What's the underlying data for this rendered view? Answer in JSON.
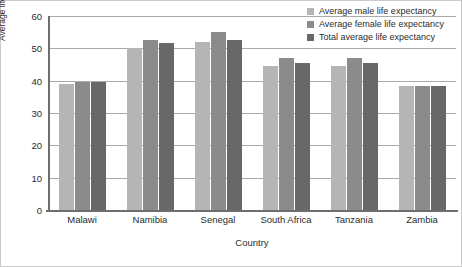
{
  "chart_data": {
    "type": "bar",
    "title": "",
    "xlabel": "Country",
    "ylabel": "Average life expectancy age",
    "categories": [
      "Malawi",
      "Namibia",
      "Senegal",
      "South Africa",
      "Tanzania",
      "Zambia"
    ],
    "series": [
      {
        "name": "Average male life expectancy",
        "color": "#b5b5b5",
        "values": [
          39,
          50,
          52,
          44.5,
          44.5,
          38.5
        ]
      },
      {
        "name": "Average female life expectancy",
        "color": "#8b8b8b",
        "values": [
          39.5,
          52.5,
          55,
          47,
          47,
          38.5
        ]
      },
      {
        "name": "Total average life expectancy",
        "color": "#686868",
        "values": [
          39.5,
          51.5,
          52.5,
          45.5,
          45.5,
          38.5
        ]
      }
    ],
    "ylim": [
      0,
      60
    ],
    "yticks": [
      0,
      10,
      20,
      30,
      40,
      50,
      60
    ],
    "ytick_labels": [
      "0",
      "10",
      "20",
      "30",
      "40",
      "50",
      "60"
    ],
    "grid": true,
    "legend_position": "top-right"
  }
}
